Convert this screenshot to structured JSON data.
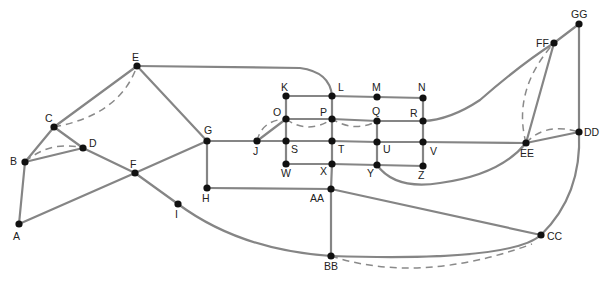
{
  "diagram": {
    "type": "graph",
    "nodes": [
      {
        "id": "A",
        "x": 19,
        "y": 224,
        "lx": 13,
        "ly": 240
      },
      {
        "id": "B",
        "x": 25,
        "y": 162,
        "lx": 10,
        "ly": 165
      },
      {
        "id": "C",
        "x": 54,
        "y": 127,
        "lx": 45,
        "ly": 122
      },
      {
        "id": "D",
        "x": 83,
        "y": 148,
        "lx": 89,
        "ly": 147
      },
      {
        "id": "E",
        "x": 137,
        "y": 66,
        "lx": 132,
        "ly": 61
      },
      {
        "id": "F",
        "x": 135,
        "y": 173,
        "lx": 130,
        "ly": 168
      },
      {
        "id": "G",
        "x": 207,
        "y": 141,
        "lx": 204,
        "ly": 134
      },
      {
        "id": "H",
        "x": 207,
        "y": 188,
        "lx": 202,
        "ly": 202
      },
      {
        "id": "I",
        "x": 178,
        "y": 204,
        "lx": 175,
        "ly": 218
      },
      {
        "id": "J",
        "x": 257,
        "y": 141,
        "lx": 253,
        "ly": 155
      },
      {
        "id": "K",
        "x": 286,
        "y": 96,
        "lx": 281,
        "ly": 91
      },
      {
        "id": "L",
        "x": 332,
        "y": 96,
        "lx": 338,
        "ly": 91
      },
      {
        "id": "M",
        "x": 377,
        "y": 97,
        "lx": 372,
        "ly": 91
      },
      {
        "id": "N",
        "x": 423,
        "y": 98,
        "lx": 418,
        "ly": 91
      },
      {
        "id": "O",
        "x": 286,
        "y": 119,
        "lx": 273,
        "ly": 116
      },
      {
        "id": "P",
        "x": 332,
        "y": 119,
        "lx": 320,
        "ly": 116
      },
      {
        "id": "Q",
        "x": 377,
        "y": 121,
        "lx": 372,
        "ly": 115
      },
      {
        "id": "R",
        "x": 423,
        "y": 121,
        "lx": 410,
        "ly": 117
      },
      {
        "id": "S",
        "x": 286,
        "y": 141,
        "lx": 291,
        "ly": 153
      },
      {
        "id": "T",
        "x": 332,
        "y": 141,
        "lx": 338,
        "ly": 153
      },
      {
        "id": "U",
        "x": 377,
        "y": 142,
        "lx": 383,
        "ly": 153
      },
      {
        "id": "V",
        "x": 423,
        "y": 142,
        "lx": 430,
        "ly": 155
      },
      {
        "id": "W",
        "x": 286,
        "y": 164,
        "lx": 281,
        "ly": 177
      },
      {
        "id": "X",
        "x": 332,
        "y": 164,
        "lx": 320,
        "ly": 175
      },
      {
        "id": "Y",
        "x": 377,
        "y": 165,
        "lx": 367,
        "ly": 177
      },
      {
        "id": "Z",
        "x": 423,
        "y": 166,
        "lx": 418,
        "ly": 179
      },
      {
        "id": "AA",
        "x": 331,
        "y": 189,
        "lx": 310,
        "ly": 202
      },
      {
        "id": "BB",
        "x": 331,
        "y": 256,
        "lx": 324,
        "ly": 270
      },
      {
        "id": "CC",
        "x": 541,
        "y": 235,
        "lx": 547,
        "ly": 240
      },
      {
        "id": "DD",
        "x": 579,
        "y": 132,
        "lx": 584,
        "ly": 136
      },
      {
        "id": "EE",
        "x": 526,
        "y": 143,
        "lx": 520,
        "ly": 157
      },
      {
        "id": "FF",
        "x": 554,
        "y": 43,
        "lx": 536,
        "ly": 47
      },
      {
        "id": "GG",
        "x": 579,
        "y": 24,
        "lx": 571,
        "ly": 18
      }
    ],
    "edges": [
      {
        "from": "A",
        "to": "B",
        "path": "M19,224 L25,162"
      },
      {
        "from": "A",
        "to": "F",
        "path": "M19,224 L135,173"
      },
      {
        "from": "B",
        "to": "C",
        "path": "M25,162 L54,127"
      },
      {
        "from": "B",
        "to": "D",
        "path": "M25,162 L83,148"
      },
      {
        "from": "C",
        "to": "E",
        "path": "M54,127 L137,66"
      },
      {
        "from": "C",
        "to": "D",
        "path": "M54,127 L83,148"
      },
      {
        "from": "D",
        "to": "F",
        "path": "M83,148 L135,173"
      },
      {
        "from": "E",
        "to": "G",
        "path": "M137,66 L207,141"
      },
      {
        "from": "E",
        "to": "L",
        "path": "M137,66 L300,68 Q330,72 332,96"
      },
      {
        "from": "F",
        "to": "G",
        "path": "M135,173 L207,141"
      },
      {
        "from": "F",
        "to": "I",
        "path": "M135,173 L178,204"
      },
      {
        "from": "I",
        "to": "BB",
        "path": "M178,204 Q240,250 331,256"
      },
      {
        "from": "G",
        "to": "H",
        "path": "M207,141 L207,188"
      },
      {
        "from": "G",
        "to": "J",
        "path": "M207,141 L257,141"
      },
      {
        "from": "H",
        "to": "AA",
        "path": "M207,188 L331,189"
      },
      {
        "from": "J",
        "to": "S",
        "path": "M257,141 L286,141"
      },
      {
        "from": "J",
        "to": "O",
        "path": "M257,141 L286,119"
      },
      {
        "from": "K",
        "to": "L",
        "path": "M286,96 L332,96"
      },
      {
        "from": "L",
        "to": "M",
        "path": "M332,96 L377,97"
      },
      {
        "from": "M",
        "to": "N",
        "path": "M377,97 L423,98"
      },
      {
        "from": "K",
        "to": "O",
        "path": "M286,96 L286,119"
      },
      {
        "from": "N",
        "to": "R",
        "path": "M423,98 L423,121"
      },
      {
        "from": "O",
        "to": "P",
        "path": "M286,119 L332,119"
      },
      {
        "from": "P",
        "to": "Q",
        "path": "M332,119 L377,121"
      },
      {
        "from": "Q",
        "to": "R",
        "path": "M377,121 L423,121"
      },
      {
        "from": "O",
        "to": "S",
        "path": "M286,119 L286,141"
      },
      {
        "from": "L",
        "to": "P",
        "path": "M332,96 L332,119"
      },
      {
        "from": "P",
        "to": "T",
        "path": "M332,119 L332,141"
      },
      {
        "from": "Q",
        "to": "U",
        "path": "M377,121 L377,142"
      },
      {
        "from": "R",
        "to": "V",
        "path": "M423,121 L423,142"
      },
      {
        "from": "S",
        "to": "T",
        "path": "M286,141 L332,141"
      },
      {
        "from": "T",
        "to": "U",
        "path": "M332,141 L377,142"
      },
      {
        "from": "U",
        "to": "V",
        "path": "M377,142 L423,142"
      },
      {
        "from": "V",
        "to": "EE",
        "path": "M423,142 L526,143"
      },
      {
        "from": "S",
        "to": "W",
        "path": "M286,141 L286,164"
      },
      {
        "from": "T",
        "to": "X",
        "path": "M332,141 L332,164"
      },
      {
        "from": "U",
        "to": "Y",
        "path": "M377,142 L377,165"
      },
      {
        "from": "V",
        "to": "Z",
        "path": "M423,142 L423,166"
      },
      {
        "from": "W",
        "to": "X",
        "path": "M286,164 L332,164"
      },
      {
        "from": "X",
        "to": "Y",
        "path": "M332,164 L377,165"
      },
      {
        "from": "Y",
        "to": "Z",
        "path": "M377,165 L423,166"
      },
      {
        "from": "X",
        "to": "AA",
        "path": "M332,164 L331,189"
      },
      {
        "from": "Y",
        "to": "EE",
        "path": "M377,165 Q395,190 440,183 Q500,175 526,143"
      },
      {
        "from": "R",
        "to": "FF",
        "path": "M423,121 Q450,120 480,100 Q520,65 554,43"
      },
      {
        "from": "AA",
        "to": "BB",
        "path": "M331,189 L331,256"
      },
      {
        "from": "AA",
        "to": "CC",
        "path": "M331,189 L541,235"
      },
      {
        "from": "BB",
        "to": "CC",
        "path": "M331,256 Q510,262 541,235"
      },
      {
        "from": "CC",
        "to": "GG",
        "path": "M541,235 Q582,195 579,132"
      },
      {
        "from": "DD",
        "to": "GG",
        "path": "M579,132 L579,24"
      },
      {
        "from": "FF",
        "to": "GG",
        "path": "M554,43 L579,24"
      },
      {
        "from": "EE",
        "to": "FF",
        "path": "M526,143 L554,43"
      },
      {
        "from": "EE",
        "to": "DD",
        "path": "M526,143 L579,132"
      }
    ],
    "dashed_edges": [
      {
        "from": "C",
        "to": "E",
        "path": "M54,127 Q120,115 137,66"
      },
      {
        "from": "B",
        "to": "D",
        "path": "M25,162 Q50,140 83,148"
      },
      {
        "from": "J",
        "to": "O",
        "path": "M257,141 Q262,120 286,119"
      },
      {
        "from": "O",
        "to": "Q",
        "path": "M286,119 Q308,135 332,119 Q355,133 377,121"
      },
      {
        "from": "EE",
        "to": "FF",
        "path": "M526,143 Q512,90 554,43"
      },
      {
        "from": "EE",
        "to": "DD",
        "path": "M526,143 Q545,122 579,132"
      },
      {
        "from": "BB",
        "to": "CC",
        "path": "M331,256 Q420,285 532,244"
      }
    ]
  }
}
